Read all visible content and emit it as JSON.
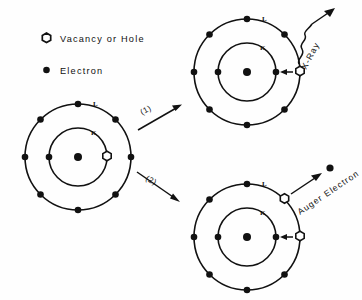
{
  "figure": {
    "background": "#fefefe",
    "ink": "#111111",
    "title": ""
  },
  "legend": {
    "items": [
      {
        "icon": "hexagon-outline-icon",
        "label": "Vacancy or Hole"
      },
      {
        "icon": "filled-dot-icon",
        "label": "Electron"
      }
    ]
  },
  "shell_labels": {
    "outer": "L",
    "inner": "K"
  },
  "transitions": [
    {
      "id": "1",
      "label": "(1)",
      "leads_to": "x-ray-atom"
    },
    {
      "id": "2",
      "label": "(2)",
      "leads_to": "auger-atom"
    }
  ],
  "atoms": {
    "initial": {
      "name": "initial-atom",
      "cx": 78,
      "cy": 157,
      "outer_r": 53,
      "inner_r": 29,
      "outer_label": "L",
      "inner_label": "K",
      "nucleus": true,
      "outer_electron_angles": [
        90,
        135,
        180,
        225,
        270,
        315,
        0,
        45
      ],
      "inner_electron_angles": [
        180
      ],
      "inner_vacancy_angles": [
        0
      ],
      "outer_vacancy_angles": []
    },
    "x_ray": {
      "name": "x-ray-atom",
      "cx": 247,
      "cy": 72,
      "outer_r": 53,
      "inner_r": 29,
      "outer_label": "L",
      "inner_label": "K",
      "nucleus": true,
      "outer_electron_angles": [
        90,
        135,
        180,
        225,
        270,
        315,
        45
      ],
      "inner_electron_angles": [
        180,
        0
      ],
      "inner_vacancy_angles": [],
      "outer_vacancy_angles": [
        0
      ]
    },
    "auger": {
      "name": "auger-atom",
      "cx": 247,
      "cy": 237,
      "outer_r": 53,
      "inner_r": 29,
      "outer_label": "L",
      "inner_label": "K",
      "nucleus": true,
      "outer_electron_angles": [
        90,
        135,
        180,
        225,
        270,
        315
      ],
      "inner_electron_angles": [
        180,
        0
      ],
      "inner_vacancy_angles": [],
      "outer_vacancy_angles": [
        0,
        45
      ]
    }
  },
  "emissions": [
    {
      "name": "x-ray-emission",
      "label": "X-Ray",
      "kind": "wavy-photon-arrow"
    },
    {
      "name": "auger-emission",
      "label": "Auger Electron",
      "kind": "straight-electron-arrow"
    }
  ]
}
